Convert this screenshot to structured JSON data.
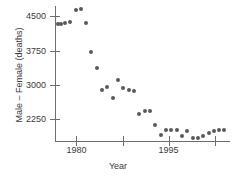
{
  "chart_data": {
    "type": "scatter",
    "title": "",
    "xlabel": "Year",
    "ylabel": "Male – Female (deaths)",
    "xlim": [
      1976.5,
      2005.0
    ],
    "ylim": [
      1780,
      4720
    ],
    "grid": false,
    "legend": null,
    "x_ticks": [
      {
        "value": 1980,
        "label": "1980"
      },
      {
        "value": 1987.5,
        "label": ""
      },
      {
        "value": 1995,
        "label": "1995"
      },
      {
        "value": 2002.5,
        "label": ""
      }
    ],
    "y_ticks": [
      {
        "value": 4500,
        "label": "4500"
      },
      {
        "value": 3750,
        "label": "3750"
      },
      {
        "value": 3000,
        "label": "3000"
      },
      {
        "value": 2250,
        "label": "2250"
      }
    ],
    "marker": {
      "shape": "circle",
      "color": "#5a5a5a",
      "size_px": 4
    },
    "points": [
      {
        "x": 1977.0,
        "y": 4330
      },
      {
        "x": 1977.5,
        "y": 4320
      },
      {
        "x": 1978.2,
        "y": 4360
      },
      {
        "x": 1979.0,
        "y": 4370
      },
      {
        "x": 1979.9,
        "y": 4640
      },
      {
        "x": 1980.7,
        "y": 4650
      },
      {
        "x": 1981.5,
        "y": 4350
      },
      {
        "x": 1982.4,
        "y": 3720
      },
      {
        "x": 1983.3,
        "y": 3380
      },
      {
        "x": 1984.2,
        "y": 2900
      },
      {
        "x": 1985.0,
        "y": 2950
      },
      {
        "x": 1985.9,
        "y": 2720
      },
      {
        "x": 1986.8,
        "y": 3110
      },
      {
        "x": 1987.6,
        "y": 2940
      },
      {
        "x": 1988.5,
        "y": 2900
      },
      {
        "x": 1989.4,
        "y": 2860
      },
      {
        "x": 1990.2,
        "y": 2360
      },
      {
        "x": 1991.1,
        "y": 2440
      },
      {
        "x": 1992.0,
        "y": 2430
      },
      {
        "x": 1992.8,
        "y": 2120
      },
      {
        "x": 1993.7,
        "y": 1920
      },
      {
        "x": 1994.6,
        "y": 2010
      },
      {
        "x": 1995.4,
        "y": 2030
      },
      {
        "x": 1996.3,
        "y": 2020
      },
      {
        "x": 1997.2,
        "y": 1890
      },
      {
        "x": 1998.0,
        "y": 1990
      },
      {
        "x": 1998.9,
        "y": 1850
      },
      {
        "x": 1999.8,
        "y": 1840
      },
      {
        "x": 2000.6,
        "y": 1880
      },
      {
        "x": 2001.5,
        "y": 1960
      },
      {
        "x": 2002.4,
        "y": 1990
      },
      {
        "x": 2003.2,
        "y": 2010
      },
      {
        "x": 2004.1,
        "y": 2030
      }
    ]
  }
}
